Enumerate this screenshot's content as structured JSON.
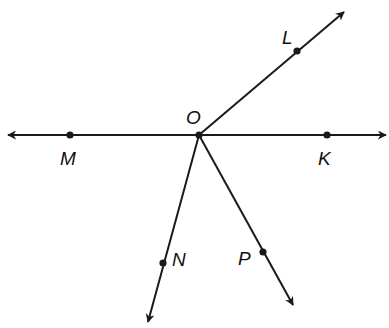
{
  "diagram": {
    "type": "geometry-rays",
    "stroke_color": "#1a1a1a",
    "top_fragment": "...",
    "vertex": {
      "name": "O",
      "x": 199,
      "y": 135,
      "label": "O",
      "label_x": 186,
      "label_y": 124
    },
    "points": [
      {
        "name": "L",
        "label": "L",
        "x": 297,
        "y": 51,
        "label_x": 282,
        "label_y": 44
      },
      {
        "name": "M",
        "label": "M",
        "x": 70,
        "y": 135,
        "label_x": 60,
        "label_y": 165
      },
      {
        "name": "K",
        "label": "K",
        "x": 327,
        "y": 135,
        "label_x": 318,
        "label_y": 165
      },
      {
        "name": "N",
        "label": "N",
        "x": 163,
        "y": 263,
        "label_x": 172,
        "label_y": 266
      },
      {
        "name": "P",
        "label": "P",
        "x": 263,
        "y": 252,
        "label_x": 238,
        "label_y": 265
      }
    ],
    "rays": [
      {
        "name": "ray-OL",
        "from": "O",
        "to_x": 344,
        "to_y": 12
      },
      {
        "name": "ray-OM",
        "from": "O",
        "to_x": 8,
        "to_y": 135
      },
      {
        "name": "ray-OK",
        "from": "O",
        "to_x": 386,
        "to_y": 135
      },
      {
        "name": "ray-ON",
        "from": "O",
        "to_x": 148,
        "to_y": 322
      },
      {
        "name": "ray-OP",
        "from": "O",
        "to_x": 293,
        "to_y": 305
      }
    ]
  }
}
